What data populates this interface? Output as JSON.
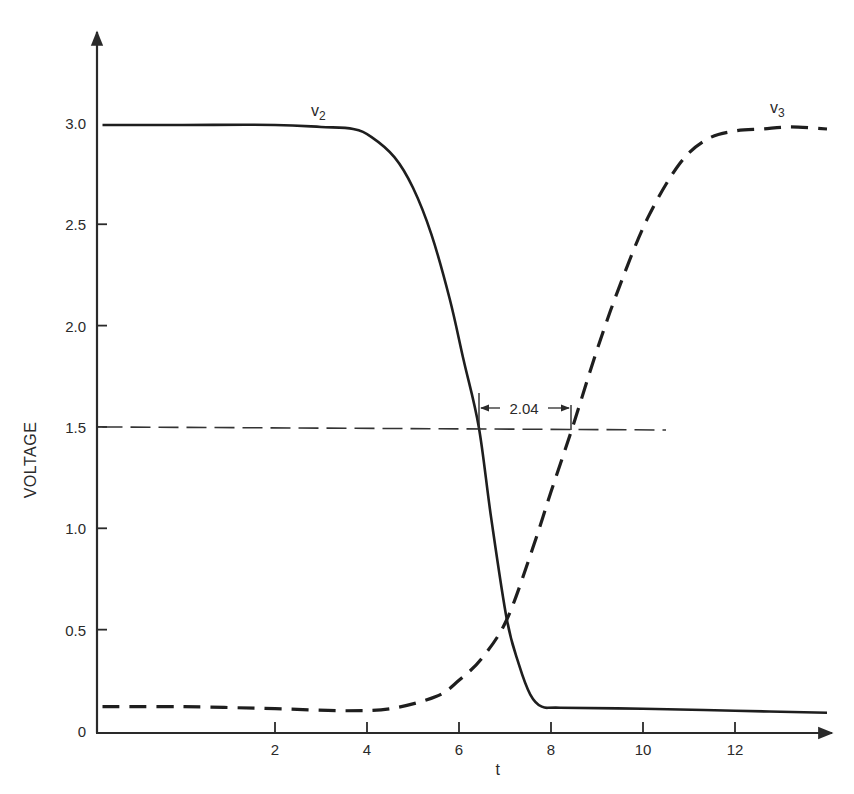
{
  "chart_data": {
    "type": "line",
    "title": "",
    "xlabel": "t",
    "ylabel": "VOLTAGE",
    "xlim": [
      -1.9,
      14.3
    ],
    "ylim": [
      0,
      3.5
    ],
    "grid": false,
    "legend": "inline labels near curves",
    "x_ticks": [
      2,
      4,
      6,
      8,
      10,
      12
    ],
    "x_tick_labels": [
      "2",
      "4",
      "6",
      "8",
      "10",
      "12"
    ],
    "y_ticks": [
      0,
      0.5,
      1.0,
      1.5,
      2.0,
      2.5,
      3.0
    ],
    "y_tick_labels": [
      "0",
      "0.5",
      "1.0",
      "1.5",
      "2.0",
      "2.5",
      "3.0"
    ],
    "series": [
      {
        "name": "v2",
        "label_main": "v",
        "label_sub": "2",
        "style": "solid",
        "x": [
          -1.75,
          0,
          2,
          3.0,
          3.7,
          4.1,
          4.6,
          5.0,
          5.4,
          5.8,
          6.1,
          6.43,
          6.7,
          7.04,
          7.3,
          7.55,
          7.8,
          8.2,
          10,
          12,
          14.0
        ],
        "y": [
          2.99,
          2.99,
          2.99,
          2.98,
          2.97,
          2.93,
          2.83,
          2.68,
          2.45,
          2.13,
          1.83,
          1.5,
          1.05,
          0.55,
          0.33,
          0.18,
          0.12,
          0.115,
          0.11,
          0.1,
          0.09
        ]
      },
      {
        "name": "v3",
        "label_main": "v",
        "label_sub": "3",
        "style": "dashed",
        "x": [
          -1.75,
          0,
          2,
          3.5,
          4.5,
          5.5,
          6.0,
          6.5,
          7.04,
          7.6,
          8.0,
          8.47,
          9.0,
          9.5,
          10.1,
          10.8,
          11.4,
          12.0,
          12.6,
          13.2,
          14.0
        ],
        "y": [
          0.12,
          0.12,
          0.11,
          0.1,
          0.11,
          0.17,
          0.25,
          0.36,
          0.55,
          0.9,
          1.18,
          1.5,
          1.88,
          2.2,
          2.53,
          2.8,
          2.92,
          2.96,
          2.97,
          2.98,
          2.97
        ]
      },
      {
        "name": "1.5 V reference",
        "style": "thin-dashed",
        "x": [
          -1.75,
          10.5
        ],
        "y": [
          1.5,
          1.485
        ]
      }
    ],
    "annotations": [
      {
        "text": "2.04",
        "type": "interval",
        "x_start": 6.43,
        "x_end": 8.47,
        "y": 1.5,
        "meaning": "delay between v2 and v3 crossing 1.5 V"
      }
    ]
  }
}
